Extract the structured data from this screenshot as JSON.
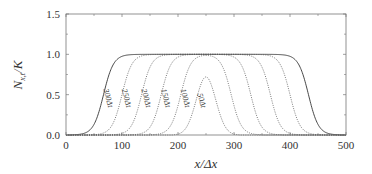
{
  "chart_data": {
    "type": "line",
    "title": "",
    "xlabel": "x/Δx",
    "ylabel": "N_x,t/K",
    "xlim": [
      0,
      500
    ],
    "ylim": [
      0.0,
      1.5
    ],
    "xticks": [
      "0",
      "100",
      "200",
      "300",
      "400",
      "500"
    ],
    "yticks": [
      "0.0",
      "0.5",
      "1.0",
      "1.5"
    ],
    "grid": false,
    "legend": "inline curve labels",
    "series": [
      {
        "name": "300Δt",
        "style": "solid",
        "center": 250,
        "half_width": 183,
        "peak": 1.0
      },
      {
        "name": "250Δt",
        "style": "dotted",
        "center": 250,
        "half_width": 150,
        "peak": 1.0
      },
      {
        "name": "200Δt",
        "style": "dotted",
        "center": 250,
        "half_width": 115,
        "peak": 1.0
      },
      {
        "name": "150Δt",
        "style": "dotted",
        "center": 250,
        "half_width": 80,
        "peak": 1.0
      },
      {
        "name": "100Δt",
        "style": "dotted",
        "center": 250,
        "half_width": 45,
        "peak": 1.0
      },
      {
        "name": "50Δt",
        "style": "dotted",
        "center": 250,
        "half_width": 22,
        "peak": 0.72
      }
    ]
  },
  "labels": {
    "x_axis": "x/Δx",
    "y_axis_main": "N",
    "y_axis_sub": "x,t",
    "y_axis_tail": "/K"
  }
}
